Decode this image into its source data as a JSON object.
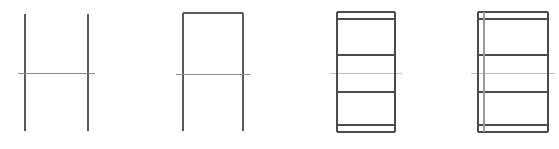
{
  "page": {
    "background_color": "#ffffff",
    "width": 559,
    "height": 149,
    "figure_count": 4
  },
  "palette": {
    "stroke_dark": "#4a4a4a",
    "stroke_medium": "#6e6e6e",
    "stroke_light": "#a8a8a8",
    "stroke_faint": "#c4c4c4",
    "background": "#ffffff"
  },
  "chart_data": {
    "type": "diagram",
    "xlabel": "",
    "ylabel": "",
    "figures": [
      {
        "name": "figure-1-h-shape",
        "label": "H shape",
        "description": "Two vertical lines joined by a single horizontal crossbar, open at top and bottom",
        "bounds": {
          "x": 25,
          "y": 14,
          "width": 63,
          "height": 117
        },
        "segments": [
          {
            "id": "left-vertical",
            "x1": 25,
            "y1": 14,
            "x2": 25,
            "y2": 131,
            "color": "#5a5a5a",
            "width": 1.4
          },
          {
            "id": "right-vertical",
            "x1": 88,
            "y1": 14,
            "x2": 88,
            "y2": 131,
            "color": "#5a5a5a",
            "width": 1.4
          },
          {
            "id": "crossbar",
            "x1": 18,
            "y1": 73,
            "x2": 95,
            "y2": 73,
            "color": "#8a8a8a",
            "width": 1.0
          }
        ]
      },
      {
        "name": "figure-2-closed-top",
        "label": "H shape closed at top",
        "description": "Same two verticals with crossbar, plus a top horizontal closing the upper portion into a rectangle",
        "bounds": {
          "x": 183,
          "y": 13,
          "width": 60,
          "height": 118
        },
        "segments": [
          {
            "id": "top-horizontal",
            "x1": 183,
            "y1": 13,
            "x2": 243,
            "y2": 13,
            "color": "#5a5a5a",
            "width": 1.4
          },
          {
            "id": "left-vertical",
            "x1": 183,
            "y1": 13,
            "x2": 183,
            "y2": 131,
            "color": "#5a5a5a",
            "width": 1.4
          },
          {
            "id": "right-vertical",
            "x1": 243,
            "y1": 13,
            "x2": 243,
            "y2": 131,
            "color": "#5a5a5a",
            "width": 1.4
          },
          {
            "id": "crossbar",
            "x1": 176,
            "y1": 74,
            "x2": 250,
            "y2": 74,
            "color": "#8a8a8a",
            "width": 1.0
          }
        ]
      },
      {
        "name": "figure-3-banded-rectangle",
        "label": "Closed rectangle with horizontal bands",
        "description": "Fully closed rectangle divided by horizontal lines into a thin top band, two large middle bands split by a faint line, and a thin bottom band",
        "bounds": {
          "x": 337,
          "y": 12,
          "width": 58,
          "height": 120
        },
        "segments": [
          {
            "id": "outer-top",
            "x1": 337,
            "y1": 12,
            "x2": 395,
            "y2": 12,
            "color": "#4a4a4a",
            "width": 1.4
          },
          {
            "id": "top-band-divider",
            "x1": 337,
            "y1": 19,
            "x2": 395,
            "y2": 19,
            "color": "#4a4a4a",
            "width": 1.4
          },
          {
            "id": "upper-divider",
            "x1": 337,
            "y1": 55,
            "x2": 395,
            "y2": 55,
            "color": "#4a4a4a",
            "width": 1.6
          },
          {
            "id": "middle-faint-divider",
            "x1": 330,
            "y1": 73,
            "x2": 402,
            "y2": 73,
            "color": "#c0c0c0",
            "width": 1.0
          },
          {
            "id": "lower-divider",
            "x1": 337,
            "y1": 92,
            "x2": 395,
            "y2": 92,
            "color": "#4a4a4a",
            "width": 1.6
          },
          {
            "id": "bottom-band-divider",
            "x1": 337,
            "y1": 125,
            "x2": 395,
            "y2": 125,
            "color": "#4a4a4a",
            "width": 1.4
          },
          {
            "id": "outer-bottom",
            "x1": 337,
            "y1": 132,
            "x2": 395,
            "y2": 132,
            "color": "#4a4a4a",
            "width": 1.4
          },
          {
            "id": "left-vertical",
            "x1": 337,
            "y1": 12,
            "x2": 337,
            "y2": 132,
            "color": "#4a4a4a",
            "width": 1.4
          },
          {
            "id": "right-vertical",
            "x1": 395,
            "y1": 12,
            "x2": 395,
            "y2": 132,
            "color": "#4a4a4a",
            "width": 1.4
          }
        ]
      },
      {
        "name": "figure-4-banded-rectangle-with-inner-vertical",
        "label": "Banded rectangle with interior vertical line",
        "description": "Same banded rectangle as figure 3 with an additional full-height vertical line just inside the left edge",
        "bounds": {
          "x": 478,
          "y": 12,
          "width": 70,
          "height": 120
        },
        "segments": [
          {
            "id": "outer-top",
            "x1": 478,
            "y1": 12,
            "x2": 548,
            "y2": 12,
            "color": "#4a4a4a",
            "width": 1.4
          },
          {
            "id": "top-band-divider",
            "x1": 478,
            "y1": 19,
            "x2": 548,
            "y2": 19,
            "color": "#4a4a4a",
            "width": 1.4
          },
          {
            "id": "upper-divider",
            "x1": 478,
            "y1": 55,
            "x2": 548,
            "y2": 55,
            "color": "#4a4a4a",
            "width": 1.6
          },
          {
            "id": "middle-faint-divider",
            "x1": 471,
            "y1": 73,
            "x2": 555,
            "y2": 73,
            "color": "#c0c0c0",
            "width": 1.0
          },
          {
            "id": "lower-divider",
            "x1": 478,
            "y1": 92,
            "x2": 548,
            "y2": 92,
            "color": "#4a4a4a",
            "width": 1.6
          },
          {
            "id": "bottom-band-divider",
            "x1": 478,
            "y1": 125,
            "x2": 548,
            "y2": 125,
            "color": "#4a4a4a",
            "width": 1.4
          },
          {
            "id": "outer-bottom",
            "x1": 478,
            "y1": 132,
            "x2": 548,
            "y2": 132,
            "color": "#4a4a4a",
            "width": 1.4
          },
          {
            "id": "left-vertical",
            "x1": 478,
            "y1": 12,
            "x2": 478,
            "y2": 132,
            "color": "#4a4a4a",
            "width": 1.4
          },
          {
            "id": "inner-vertical",
            "x1": 484,
            "y1": 12,
            "x2": 484,
            "y2": 132,
            "color": "#9a9a9a",
            "width": 1.2
          },
          {
            "id": "right-vertical",
            "x1": 548,
            "y1": 12,
            "x2": 548,
            "y2": 132,
            "color": "#4a4a4a",
            "width": 1.4
          }
        ]
      }
    ]
  }
}
